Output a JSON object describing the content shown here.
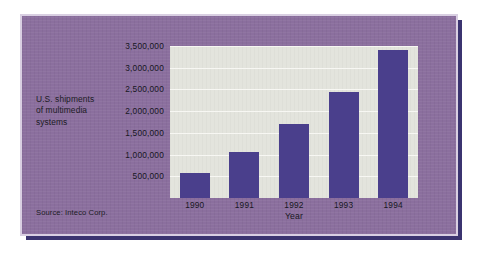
{
  "card": {
    "background_color": "#8b6f9e",
    "shadow_color": "#3b3470",
    "outline_color": "#d9cfe2"
  },
  "caption": {
    "line1": "U.S. shipments",
    "line2": "of multimedia",
    "line3": "systems"
  },
  "source": {
    "text": "Source: Inteco Corp."
  },
  "chart_data": {
    "type": "bar",
    "title": "",
    "subtitle": "",
    "categories": [
      "1990",
      "1991",
      "1992",
      "1993",
      "1994"
    ],
    "values": [
      580000,
      1050000,
      1700000,
      2450000,
      3400000
    ],
    "xlabel": "Year",
    "ylabel": "U.S. shipments of multimedia systems",
    "ylim": [
      0,
      3500000
    ],
    "yticks": [
      500000,
      1000000,
      1500000,
      2000000,
      2500000,
      3000000,
      3500000
    ],
    "ytick_labels": [
      "500,000",
      "1,000,000",
      "1,500,000",
      "2,000,000",
      "2,500,000",
      "3,000,000",
      "3,500,000"
    ],
    "grid": true,
    "legend": "none",
    "bar_color": "#4a3f8c",
    "plot_background": "#e3e4dd",
    "source": "Source: Inteco Corp."
  }
}
